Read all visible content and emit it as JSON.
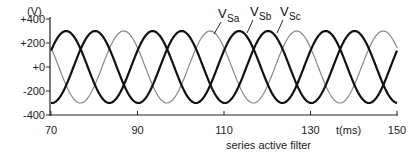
{
  "chart_data": {
    "type": "line",
    "title": "",
    "caption": "series active filter",
    "xlabel": "t(ms)",
    "ylabel": "(V)",
    "xlim": [
      70,
      150
    ],
    "ylim": [
      -400,
      400
    ],
    "x_ticks": [
      70,
      90,
      110,
      130,
      150
    ],
    "x_tick_labels": [
      "70",
      "90",
      "110",
      "130",
      "150"
    ],
    "y_ticks": [
      400,
      200,
      0,
      -200,
      -400
    ],
    "y_tick_labels": [
      "+400",
      "+200",
      "+0",
      "-200",
      "-400"
    ],
    "grid": false,
    "frequency_hz": 50,
    "amplitude_v": 300,
    "series": [
      {
        "name": "VSa",
        "label_main": "V",
        "label_sub": "Sa",
        "color": "#111111",
        "stroke_width": 2.2,
        "phase_deg": 0,
        "peak_times_ms": [
          73.5,
          93.5,
          113.5,
          133.5
        ]
      },
      {
        "name": "VSb",
        "label_main": "V",
        "label_sub": "Sb",
        "color": "#111111",
        "stroke_width": 2.2,
        "phase_deg": -120,
        "peak_times_ms": [
          80.2,
          100.2,
          120.2,
          140.2
        ]
      },
      {
        "name": "VSc",
        "label_main": "V",
        "label_sub": "Sc",
        "color": "#888888",
        "stroke_width": 1.2,
        "phase_deg": 120,
        "peak_times_ms": [
          86.8,
          106.8,
          126.8,
          146.8
        ]
      }
    ],
    "legend_position": "inline annotations near top right"
  }
}
